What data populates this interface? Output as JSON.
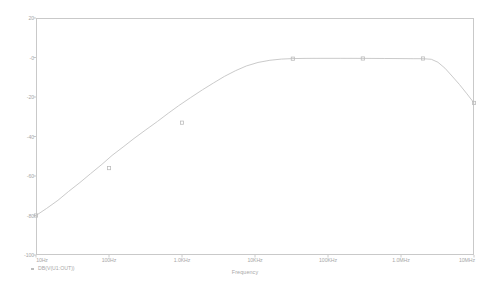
{
  "chart_data": {
    "type": "line",
    "title": "",
    "xlabel": "Frequency",
    "ylabel": "",
    "xscale": "log",
    "grid": false,
    "legend_position": "bottom-left",
    "xlim": [
      10,
      10000000
    ],
    "ylim": [
      -100,
      20
    ],
    "yticks": [
      20,
      0,
      -20,
      -40,
      -60,
      -80,
      -100
    ],
    "ytick_labels": [
      "20",
      "-0",
      "-20",
      "-40",
      "-60",
      "-80",
      "-100"
    ],
    "xticks": [
      10,
      100,
      1000,
      10000,
      100000,
      1000000,
      10000000
    ],
    "xtick_labels": [
      "10Hz",
      "100Hz",
      "1.0KHz",
      "10KHz",
      "100KHz",
      "1.0MHz",
      "10MHz"
    ],
    "series": [
      {
        "name": "DB(V(U1:OUT))",
        "marker": "square",
        "color": "#c4c4c4",
        "x": [
          10,
          100,
          1000,
          10000,
          100000,
          1000000,
          10000000
        ],
        "y": [
          -80,
          -56,
          -33,
          -0.6,
          -0.4,
          -0.4,
          -23
        ],
        "markers_x": [
          10,
          100,
          1000,
          33000,
          300000,
          2000000,
          10000000
        ],
        "markers_y": [
          -80,
          -56,
          -33,
          -0.6,
          -0.5,
          -0.5,
          -23
        ],
        "curve": [
          [
            10,
            -80
          ],
          [
            14,
            -76.4
          ],
          [
            20,
            -72.3
          ],
          [
            28,
            -67.8
          ],
          [
            40,
            -63.3
          ],
          [
            56,
            -58.8
          ],
          [
            80,
            -54.1
          ],
          [
            110,
            -49.6
          ],
          [
            160,
            -45.0
          ],
          [
            220,
            -41.0
          ],
          [
            320,
            -36.6
          ],
          [
            460,
            -32.4
          ],
          [
            650,
            -28.2
          ],
          [
            900,
            -24.4
          ],
          [
            1300,
            -20.4
          ],
          [
            1900,
            -16.4
          ],
          [
            2700,
            -12.9
          ],
          [
            3800,
            -9.6
          ],
          [
            5400,
            -6.7
          ],
          [
            7600,
            -4.3
          ],
          [
            11000,
            -2.5
          ],
          [
            16000,
            -1.4
          ],
          [
            23000,
            -0.8
          ],
          [
            33000,
            -0.55
          ],
          [
            50000,
            -0.45
          ],
          [
            80000,
            -0.42
          ],
          [
            150000,
            -0.42
          ],
          [
            300000,
            -0.45
          ],
          [
            600000,
            -0.5
          ],
          [
            1000000,
            -0.55
          ],
          [
            1500000,
            -0.6
          ],
          [
            2000000,
            -0.6
          ],
          [
            2600000,
            -0.9
          ],
          [
            3200000,
            -2.4
          ],
          [
            4000000,
            -5.4
          ],
          [
            5000000,
            -9.4
          ],
          [
            6300000,
            -13.6
          ],
          [
            8000000,
            -18.4
          ],
          [
            10000000,
            -23
          ]
        ]
      }
    ]
  },
  "axes": {
    "frame_color": "#c9c9c9",
    "tick_color": "#bcbcbc",
    "label_color": "#a8a8a8"
  },
  "legend": {
    "trace_label": "DB(V(U1:OUT))"
  }
}
